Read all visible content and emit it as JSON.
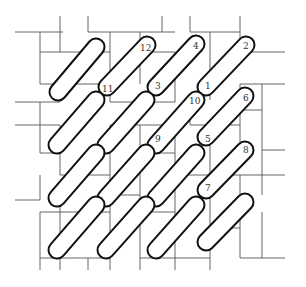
{
  "diagram": {
    "title": "",
    "colors": {
      "background": "#ffffff",
      "stroke": "#111111",
      "grid": "#555555",
      "label": "#333333"
    },
    "pill_width": 17,
    "pills": [
      {
        "x1": 58,
        "y1": 92,
        "x2": 96,
        "y2": 47
      },
      {
        "x1": 107,
        "y1": 87,
        "x2": 147,
        "y2": 45
      },
      {
        "x1": 156,
        "y1": 87,
        "x2": 196,
        "y2": 44
      },
      {
        "x1": 206,
        "y1": 87,
        "x2": 246,
        "y2": 45
      },
      {
        "x1": 57,
        "y1": 145,
        "x2": 96,
        "y2": 100
      },
      {
        "x1": 106,
        "y1": 145,
        "x2": 146,
        "y2": 100
      },
      {
        "x1": 156,
        "y1": 145,
        "x2": 196,
        "y2": 100
      },
      {
        "x1": 206,
        "y1": 137,
        "x2": 245,
        "y2": 96
      },
      {
        "x1": 57,
        "y1": 198,
        "x2": 96,
        "y2": 153
      },
      {
        "x1": 106,
        "y1": 198,
        "x2": 146,
        "y2": 153
      },
      {
        "x1": 156,
        "y1": 198,
        "x2": 196,
        "y2": 153
      },
      {
        "x1": 206,
        "y1": 190,
        "x2": 245,
        "y2": 150
      },
      {
        "x1": 57,
        "y1": 250,
        "x2": 96,
        "y2": 205
      },
      {
        "x1": 106,
        "y1": 250,
        "x2": 146,
        "y2": 205
      },
      {
        "x1": 156,
        "y1": 250,
        "x2": 196,
        "y2": 205
      },
      {
        "x1": 206,
        "y1": 242,
        "x2": 245,
        "y2": 202
      }
    ],
    "labels": [
      {
        "text": "1",
        "x": 205,
        "y": 89
      },
      {
        "text": "2",
        "x": 243,
        "y": 49
      },
      {
        "text": "3",
        "x": 155,
        "y": 89
      },
      {
        "text": "4",
        "x": 193,
        "y": 49
      },
      {
        "text": "5",
        "x": 205,
        "y": 142
      },
      {
        "text": "6",
        "x": 243,
        "y": 101
      },
      {
        "text": "7",
        "x": 205,
        "y": 191
      },
      {
        "text": "8",
        "x": 243,
        "y": 153
      },
      {
        "text": "9",
        "x": 155,
        "y": 142
      },
      {
        "text": "10",
        "x": 189,
        "y": 104
      },
      {
        "text": "11",
        "x": 102,
        "y": 92
      },
      {
        "text": "12",
        "x": 140,
        "y": 51
      }
    ],
    "grid_lines": [
      [
        15,
        32,
        63,
        32
      ],
      [
        40,
        32,
        40,
        52
      ],
      [
        40,
        52,
        110,
        52
      ],
      [
        60,
        16,
        60,
        52
      ],
      [
        88,
        16,
        88,
        32
      ],
      [
        88,
        32,
        140,
        32
      ],
      [
        110,
        32,
        110,
        84
      ],
      [
        140,
        32,
        175,
        32
      ],
      [
        162,
        16,
        162,
        32
      ],
      [
        190,
        16,
        190,
        32
      ],
      [
        190,
        32,
        240,
        32
      ],
      [
        210,
        32,
        210,
        84
      ],
      [
        240,
        16,
        240,
        52
      ],
      [
        240,
        52,
        285,
        52
      ],
      [
        40,
        52,
        40,
        84
      ],
      [
        40,
        84,
        110,
        84
      ],
      [
        60,
        84,
        60,
        102
      ],
      [
        15,
        102,
        60,
        102
      ],
      [
        140,
        32,
        140,
        84
      ],
      [
        140,
        52,
        175,
        52
      ],
      [
        175,
        52,
        175,
        102
      ],
      [
        110,
        84,
        110,
        102
      ],
      [
        110,
        102,
        175,
        102
      ],
      [
        210,
        84,
        210,
        100
      ],
      [
        240,
        84,
        285,
        84
      ],
      [
        240,
        84,
        240,
        100
      ],
      [
        262,
        84,
        262,
        100
      ],
      [
        262,
        100,
        262,
        150
      ],
      [
        262,
        150,
        285,
        150
      ],
      [
        40,
        102,
        40,
        125
      ],
      [
        15,
        125,
        60,
        125
      ],
      [
        60,
        125,
        60,
        175
      ],
      [
        40,
        125,
        40,
        153
      ],
      [
        40,
        153,
        60,
        153
      ],
      [
        60,
        175,
        110,
        175
      ],
      [
        110,
        125,
        110,
        175
      ],
      [
        110,
        125,
        175,
        125
      ],
      [
        140,
        125,
        140,
        153
      ],
      [
        175,
        125,
        175,
        165
      ],
      [
        140,
        153,
        175,
        153
      ],
      [
        190,
        110,
        190,
        125
      ],
      [
        190,
        125,
        240,
        125
      ],
      [
        210,
        125,
        210,
        175
      ],
      [
        240,
        110,
        262,
        110
      ],
      [
        240,
        110,
        240,
        165
      ],
      [
        40,
        175,
        40,
        200
      ],
      [
        40,
        200,
        15,
        200
      ],
      [
        60,
        200,
        60,
        212
      ],
      [
        40,
        212,
        110,
        212
      ],
      [
        110,
        175,
        110,
        212
      ],
      [
        110,
        195,
        140,
        195
      ],
      [
        140,
        165,
        140,
        212
      ],
      [
        140,
        212,
        175,
        212
      ],
      [
        175,
        165,
        175,
        212
      ],
      [
        210,
        175,
        210,
        212
      ],
      [
        175,
        175,
        262,
        175
      ],
      [
        240,
        175,
        240,
        195
      ],
      [
        262,
        175,
        285,
        175
      ],
      [
        262,
        150,
        262,
        195
      ],
      [
        40,
        212,
        40,
        258
      ],
      [
        40,
        258,
        110,
        258
      ],
      [
        60,
        212,
        60,
        258
      ],
      [
        110,
        212,
        110,
        258
      ],
      [
        110,
        258,
        110,
        270
      ],
      [
        140,
        212,
        140,
        270
      ],
      [
        140,
        258,
        210,
        258
      ],
      [
        175,
        212,
        175,
        270
      ],
      [
        210,
        212,
        210,
        270
      ],
      [
        210,
        228,
        240,
        228
      ],
      [
        240,
        212,
        240,
        258
      ],
      [
        240,
        258,
        285,
        258
      ],
      [
        262,
        212,
        262,
        258
      ],
      [
        40,
        258,
        40,
        270
      ],
      [
        60,
        258,
        60,
        270
      ],
      [
        88,
        258,
        88,
        270
      ]
    ]
  }
}
